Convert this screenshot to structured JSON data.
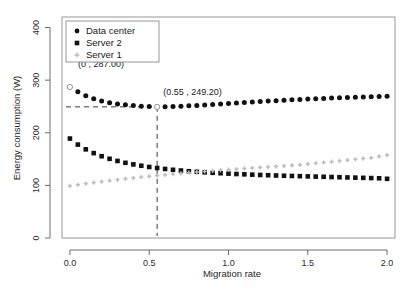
{
  "chart_data": {
    "type": "scatter",
    "title": "",
    "xlabel": "Migration rate",
    "ylabel": "Energy consumption (W)",
    "xlim": [
      -0.05,
      2.05
    ],
    "ylim": [
      0,
      420
    ],
    "xticks": [
      0.0,
      0.5,
      1.0,
      1.5,
      2.0
    ],
    "xtick_labels": [
      "0.0",
      "0.5",
      "1.0",
      "1.5",
      "2.0"
    ],
    "yticks": [
      0,
      100,
      200,
      300,
      400
    ],
    "ytick_labels": [
      "0",
      "100",
      "200",
      "300",
      "400"
    ],
    "grid": false,
    "legend_position": "top-left",
    "x": [
      0.0,
      0.05,
      0.1,
      0.15,
      0.2,
      0.25,
      0.3,
      0.35,
      0.4,
      0.45,
      0.5,
      0.55,
      0.6,
      0.65,
      0.7,
      0.75,
      0.8,
      0.85,
      0.9,
      0.95,
      1.0,
      1.05,
      1.1,
      1.15,
      1.2,
      1.25,
      1.3,
      1.35,
      1.4,
      1.45,
      1.5,
      1.55,
      1.6,
      1.65,
      1.7,
      1.75,
      1.8,
      1.85,
      1.9,
      1.95,
      2.0
    ],
    "series": [
      {
        "name": "Data center",
        "marker": "circle",
        "color": "#111111",
        "values": [
          287.0,
          278.0,
          270.5,
          264.8,
          260.5,
          257.2,
          254.8,
          253.0,
          251.6,
          250.5,
          249.7,
          249.2,
          249.4,
          249.8,
          250.4,
          251.1,
          251.9,
          252.8,
          253.7,
          254.7,
          255.6,
          256.6,
          257.5,
          258.4,
          259.3,
          260.2,
          261.0,
          261.8,
          262.6,
          263.3,
          264.0,
          264.7,
          265.3,
          265.9,
          266.5,
          267.0,
          267.5,
          268.0,
          268.4,
          268.8,
          269.2
        ]
      },
      {
        "name": "Server 2",
        "marker": "square",
        "color": "#111111",
        "values": [
          189.0,
          177.5,
          168.5,
          161.3,
          155.4,
          150.5,
          146.4,
          142.9,
          139.9,
          137.3,
          135.0,
          133.0,
          131.2,
          129.6,
          128.2,
          126.9,
          125.8,
          124.8,
          123.9,
          123.1,
          122.3,
          121.6,
          121.0,
          120.4,
          119.8,
          119.3,
          118.8,
          118.3,
          117.9,
          117.5,
          117.1,
          116.7,
          116.3,
          115.9,
          115.5,
          115.1,
          114.7,
          114.3,
          113.9,
          113.5,
          112.5
        ]
      },
      {
        "name": "Server 1",
        "marker": "plus",
        "color": "#bdbdbd",
        "values": [
          99.0,
          101.2,
          103.3,
          105.3,
          107.2,
          109.0,
          110.8,
          112.5,
          114.1,
          115.7,
          117.2,
          118.7,
          120.1,
          121.5,
          122.8,
          124.1,
          125.3,
          126.5,
          127.7,
          128.8,
          129.9,
          131.0,
          132.0,
          133.0,
          134.0,
          135.0,
          136.0,
          137.0,
          138.0,
          139.0,
          140.5,
          142.0,
          143.5,
          145.0,
          146.5,
          148.0,
          149.5,
          151.0,
          152.5,
          155.0,
          157.5
        ]
      }
    ],
    "annotations": [
      {
        "label": "(0 , 287.00)",
        "x": 0.0,
        "y": 287.0
      },
      {
        "label": "(0.55 , 249.20)",
        "x": 0.55,
        "y": 249.2
      }
    ],
    "reference_lines": {
      "horizontal_y": 249.2,
      "vertical_x": 0.55
    }
  },
  "legend": {
    "items": [
      {
        "label": "Data center",
        "marker": "circle",
        "color": "#111111"
      },
      {
        "label": "Server 2",
        "marker": "square",
        "color": "#111111"
      },
      {
        "label": "Server 1",
        "marker": "plus",
        "color": "#bdbdbd"
      }
    ]
  }
}
